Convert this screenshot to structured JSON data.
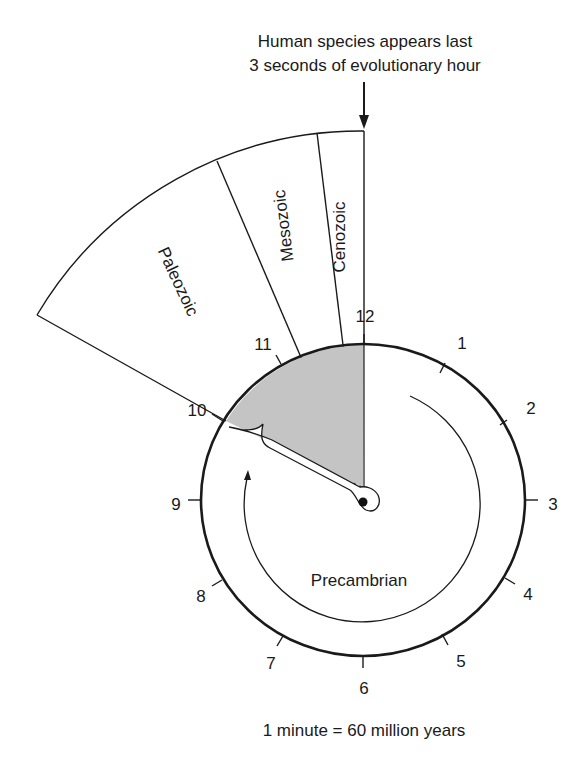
{
  "title": {
    "line1": "Human species appears last",
    "line2": "3 seconds of evolutionary hour"
  },
  "eras": {
    "cenozoic": "Cenozoic",
    "mesozoic": "Mesozoic",
    "paleozoic": "Paleozoic",
    "precambrian": "Precambrian"
  },
  "clock": {
    "hours": [
      "12",
      "1",
      "2",
      "3",
      "4",
      "5",
      "6",
      "7",
      "8",
      "9",
      "10",
      "11"
    ]
  },
  "caption": "1 minute = 60 million years",
  "colors": {
    "shade": "#c4c4c4",
    "stroke": "#1a1a1a",
    "background": "#ffffff"
  }
}
